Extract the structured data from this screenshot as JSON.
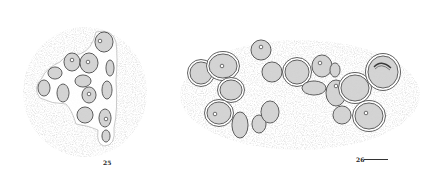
{
  "figure": {
    "type": "stippled micrograph drawing plate",
    "colors": {
      "background": "#ffffff",
      "stipple": "#c8c8c8",
      "cell_fill": "#d6d6d6",
      "outline": "#3a3a3a"
    },
    "panels": [
      {
        "label": "25",
        "label_pos": [
          103,
          163
        ],
        "matrix": {
          "cx": 85,
          "cy": 92,
          "rx": 62,
          "ry": 65
        },
        "cells": [
          {
            "cx": 104,
            "cy": 42,
            "rx": 9,
            "ry": 10,
            "nucleus": [
              100,
              41
            ],
            "ring": false
          },
          {
            "cx": 72,
            "cy": 62,
            "rx": 8,
            "ry": 9,
            "nucleus": [
              72,
              60
            ],
            "ring": false
          },
          {
            "cx": 89,
            "cy": 63,
            "rx": 9,
            "ry": 10,
            "nucleus": [
              88,
              62
            ],
            "ring": false
          },
          {
            "cx": 55,
            "cy": 73,
            "rx": 7,
            "ry": 6,
            "nucleus": null,
            "ring": false
          },
          {
            "cx": 110,
            "cy": 68,
            "rx": 4,
            "ry": 8,
            "nucleus": null,
            "ring": false
          },
          {
            "cx": 44,
            "cy": 88,
            "rx": 6,
            "ry": 8,
            "nucleus": null,
            "ring": false
          },
          {
            "cx": 83,
            "cy": 81,
            "rx": 8,
            "ry": 6,
            "nucleus": null,
            "ring": false
          },
          {
            "cx": 107,
            "cy": 90,
            "rx": 5,
            "ry": 9,
            "nucleus": null,
            "ring": false
          },
          {
            "cx": 63,
            "cy": 93,
            "rx": 6,
            "ry": 9,
            "nucleus": null,
            "ring": false
          },
          {
            "cx": 89,
            "cy": 95,
            "rx": 7,
            "ry": 8,
            "nucleus": [
              89,
              94
            ],
            "ring": false
          },
          {
            "cx": 85,
            "cy": 115,
            "rx": 8,
            "ry": 8,
            "nucleus": null,
            "ring": false
          },
          {
            "cx": 105,
            "cy": 118,
            "rx": 6,
            "ry": 9,
            "nucleus": [
              106,
              119
            ],
            "ring": false
          },
          {
            "cx": 106,
            "cy": 136,
            "rx": 4,
            "ry": 6,
            "nucleus": null,
            "ring": false
          }
        ]
      },
      {
        "label": "26",
        "label_pos": [
          356,
          162
        ],
        "scale_bar": {
          "x1": 364,
          "x2": 388,
          "y": 159
        },
        "matrix": {
          "cx": 300,
          "cy": 95,
          "rx": 120,
          "ry": 55
        },
        "cells": [
          {
            "cx": 261,
            "cy": 50,
            "rx": 10,
            "ry": 10,
            "nucleus": [
              261,
              47
            ],
            "ring": false
          },
          {
            "cx": 201,
            "cy": 73,
            "rx": 11,
            "ry": 11,
            "nucleus": null,
            "ring": true
          },
          {
            "cx": 223,
            "cy": 66,
            "rx": 14,
            "ry": 12,
            "nucleus": [
              222,
              66
            ],
            "ring": true
          },
          {
            "cx": 231,
            "cy": 90,
            "rx": 11,
            "ry": 10,
            "nucleus": null,
            "ring": true
          },
          {
            "cx": 219,
            "cy": 113,
            "rx": 12,
            "ry": 11,
            "nucleus": [
              215,
              114
            ],
            "ring": true
          },
          {
            "cx": 240,
            "cy": 125,
            "rx": 8,
            "ry": 13,
            "nucleus": null,
            "ring": false
          },
          {
            "cx": 259,
            "cy": 124,
            "rx": 7,
            "ry": 9,
            "nucleus": null,
            "ring": false
          },
          {
            "cx": 270,
            "cy": 112,
            "rx": 9,
            "ry": 11,
            "nucleus": null,
            "ring": false
          },
          {
            "cx": 272,
            "cy": 72,
            "rx": 10,
            "ry": 10,
            "nucleus": null,
            "ring": false
          },
          {
            "cx": 297,
            "cy": 72,
            "rx": 12,
            "ry": 12,
            "nucleus": null,
            "ring": true
          },
          {
            "cx": 322,
            "cy": 66,
            "rx": 10,
            "ry": 11,
            "nucleus": [
              320,
              63
            ],
            "ring": false
          },
          {
            "cx": 335,
            "cy": 70,
            "rx": 5,
            "ry": 7,
            "nucleus": null,
            "ring": false
          },
          {
            "cx": 314,
            "cy": 88,
            "rx": 12,
            "ry": 7,
            "nucleus": null,
            "ring": false
          },
          {
            "cx": 336,
            "cy": 93,
            "rx": 10,
            "ry": 13,
            "nucleus": [
              336,
              86
            ],
            "ring": false
          },
          {
            "cx": 355,
            "cy": 88,
            "rx": 14,
            "ry": 13,
            "nucleus": null,
            "ring": true
          },
          {
            "cx": 383,
            "cy": 72,
            "rx": 15,
            "ry": 16,
            "nucleus": null,
            "ring": true,
            "inner_arc": true
          },
          {
            "cx": 342,
            "cy": 115,
            "rx": 9,
            "ry": 9,
            "nucleus": null,
            "ring": false
          },
          {
            "cx": 369,
            "cy": 116,
            "rx": 14,
            "ry": 13,
            "nucleus": [
              366,
              113
            ],
            "ring": true
          }
        ]
      }
    ]
  }
}
